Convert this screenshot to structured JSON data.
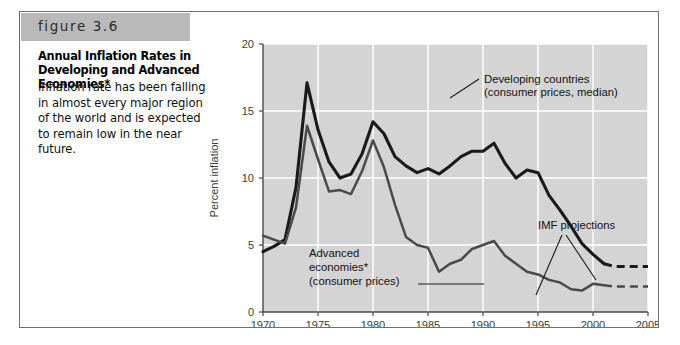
{
  "figure": {
    "tag": "figure 3.6",
    "title": "Annual Inflation Rates in Developing and Advanced Economies*",
    "description": "Inflation rate has been falling in almost every major region of the world and is expected to remain low in the near future."
  },
  "chart_data": {
    "type": "line",
    "title": "",
    "xlabel": "",
    "ylabel": "Percent inflation",
    "xlim": [
      1970,
      2005
    ],
    "ylim": [
      0,
      20
    ],
    "xticks": [
      "1970",
      "1975",
      "1980",
      "1985",
      "1990",
      "1995",
      "2000",
      "2005"
    ],
    "yticks": [
      "0",
      "5",
      "10",
      "15",
      "20"
    ],
    "grid": true,
    "plot_background": "#d4d4d4",
    "gridline_color": "#ffffff",
    "legend": "annotations",
    "x": [
      1970,
      1971,
      1972,
      1973,
      1974,
      1975,
      1976,
      1977,
      1978,
      1979,
      1980,
      1981,
      1982,
      1983,
      1984,
      1985,
      1986,
      1987,
      1988,
      1989,
      1990,
      1991,
      1992,
      1993,
      1994,
      1995,
      1996,
      1997,
      1998,
      1999,
      2000,
      2001
    ],
    "series": [
      {
        "name": "Developing countries (consumer prices, median)",
        "color": "#1a1a1a",
        "line_width": 3.1,
        "values": [
          4.5,
          4.9,
          5.4,
          9.3,
          17.1,
          13.6,
          11.2,
          10.0,
          10.3,
          11.8,
          14.2,
          13.3,
          11.6,
          10.9,
          10.4,
          10.7,
          10.3,
          10.9,
          11.6,
          12.0,
          12.0,
          12.6,
          11.1,
          10.0,
          10.6,
          10.4,
          8.7,
          7.6,
          6.4,
          5.1,
          4.3,
          3.6
        ],
        "projection": {
          "x": [
            2001,
            2002,
            2003,
            2004,
            2005
          ],
          "values": [
            3.6,
            3.4,
            3.4,
            3.4,
            3.4
          ],
          "style": "dashed"
        }
      },
      {
        "name": "Advanced economies* (consumer prices)",
        "color": "#4a4a4a",
        "line_width": 2.5,
        "values": [
          5.7,
          5.4,
          5.1,
          7.8,
          13.9,
          11.4,
          9.0,
          9.1,
          8.8,
          10.5,
          12.8,
          10.8,
          8.0,
          5.6,
          5.0,
          4.8,
          3.0,
          3.6,
          3.9,
          4.7,
          5.0,
          5.3,
          4.2,
          3.6,
          3.0,
          2.8,
          2.4,
          2.2,
          1.7,
          1.6,
          2.1,
          2.0
        ],
        "projection": {
          "x": [
            2001,
            2002,
            2003,
            2004,
            2005
          ],
          "values": [
            2.0,
            1.9,
            1.9,
            1.9,
            1.9
          ],
          "style": "dashed"
        }
      }
    ],
    "annotations": [
      {
        "name": "developing-countries-label",
        "lines": [
          "Developing countries",
          "(consumer prices, median)"
        ]
      },
      {
        "name": "advanced-economies-label",
        "lines": [
          "Advanced",
          "economies*",
          "(consumer prices)"
        ]
      },
      {
        "name": "imf-projections-label",
        "lines": [
          "IMF projections"
        ]
      }
    ]
  }
}
